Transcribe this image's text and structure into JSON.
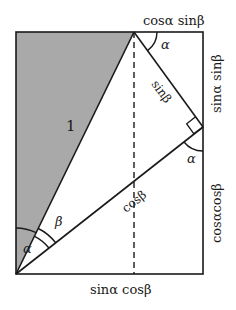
{
  "diagram": {
    "type": "trigonometric-angle-sum-proof",
    "colors": {
      "shade": "#a9a9a9",
      "stroke": "#1a1a1a",
      "background": "#ffffff"
    },
    "labels": {
      "hypotenuse": "1",
      "top_edge_right": "cosα sinβ",
      "right_edge_top": "sinα sinβ",
      "right_edge_bottom": "cosαcosβ",
      "bottom_edge": "sinα cosβ",
      "inner_sin": "sinβ",
      "inner_cos": "cosβ",
      "angle_alpha_top": "α",
      "angle_alpha_right": "α",
      "angle_alpha_origin": "α",
      "angle_beta": "β"
    }
  }
}
